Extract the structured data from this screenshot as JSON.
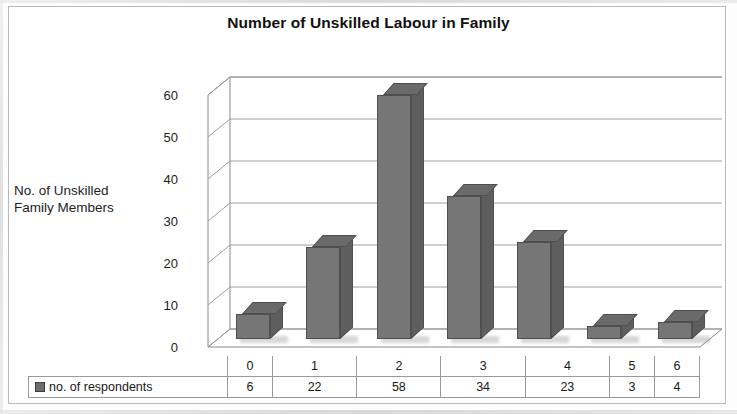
{
  "chart_data": {
    "type": "bar",
    "title": "Number of Unskilled Labour in Family",
    "xlabel": "",
    "ylabel": "No. of Unskilled Family Members",
    "categories": [
      "0",
      "1",
      "2",
      "3",
      "4",
      "5",
      "6"
    ],
    "values": [
      6,
      22,
      58,
      34,
      23,
      3,
      4
    ],
    "series": [
      {
        "name": "no. of respondents",
        "values": [
          6,
          22,
          58,
          34,
          23,
          3,
          4
        ]
      }
    ],
    "ylim": [
      0,
      60
    ],
    "yticks": [
      0,
      10,
      20,
      30,
      40,
      50,
      60
    ],
    "ytick_labels": [
      "0",
      "10",
      "20",
      "30",
      "40",
      "50",
      "60"
    ],
    "grid": true,
    "legend_position": "bottom-table",
    "style": "3d-column",
    "bar_color": "#767676",
    "bar_top_color": "#6a6a6a",
    "bar_side_color": "#5e5e5e",
    "gridline_color": "#9e9e9e",
    "axis_color": "#8a8a8a"
  },
  "axis_title": {
    "line1": "No. of Unskilled",
    "line2": "Family Members"
  },
  "table": {
    "legend_label": "no. of respondents",
    "header": [
      "0",
      "1",
      "2",
      "3",
      "4",
      "5",
      "6"
    ],
    "row": [
      "6",
      "22",
      "58",
      "34",
      "23",
      "3",
      "4"
    ]
  }
}
